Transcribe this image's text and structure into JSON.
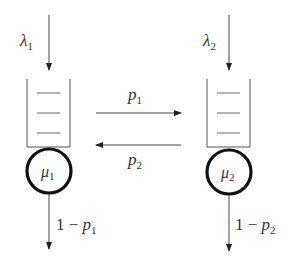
{
  "diagram": {
    "type": "queueing-network",
    "nodes": [
      {
        "id": "queue-1",
        "arrival_rate": {
          "sym": "λ",
          "sub": "1"
        },
        "service_rate": {
          "sym": "μ",
          "sub": "1"
        },
        "exit_prob": {
          "prefix": "1 − ",
          "sym": "p",
          "sub": "1"
        }
      },
      {
        "id": "queue-2",
        "arrival_rate": {
          "sym": "λ",
          "sub": "2"
        },
        "service_rate": {
          "sym": "μ",
          "sub": "2"
        },
        "exit_prob": {
          "prefix": "1 − ",
          "sym": "p",
          "sub": "2"
        }
      }
    ],
    "edges": [
      {
        "from": "queue-1",
        "to": "queue-2",
        "label": {
          "sym": "p",
          "sub": "1"
        }
      },
      {
        "from": "queue-2",
        "to": "queue-1",
        "label": {
          "sym": "p",
          "sub": "2"
        }
      }
    ],
    "colors": {
      "line": "#333333",
      "circle": "#111111"
    }
  }
}
